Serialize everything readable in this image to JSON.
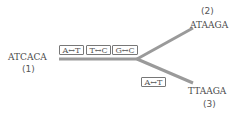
{
  "diagram": {
    "type": "phylogenetic-branching",
    "root": {
      "sequence": "ATCACA",
      "label": "(1)"
    },
    "branches": [
      {
        "sequence": "ATAAGA",
        "label": "(2)"
      },
      {
        "sequence": "TTAAGA",
        "label": "(3)"
      }
    ],
    "trunk_mutations": [
      "A↔T",
      "T↔C",
      "G↔C"
    ],
    "lower_branch_mutations": [
      "A↔T"
    ],
    "colors": {
      "line": "#9a9a9a",
      "text": "#4a4a4a",
      "box_border": "#777777"
    }
  }
}
